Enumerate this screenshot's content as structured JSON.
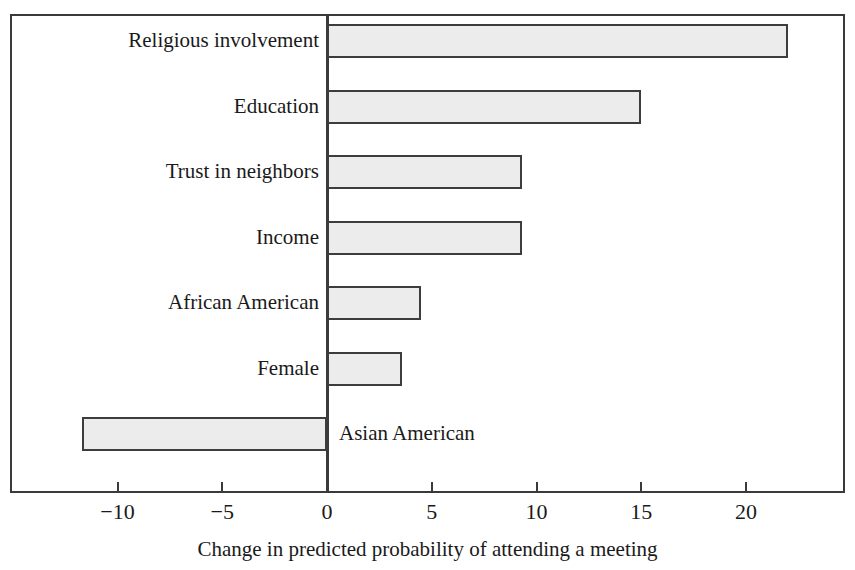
{
  "chart_data": {
    "type": "bar",
    "orientation": "horizontal",
    "title": "",
    "caption": "Change in predicted probability of attending a meeting",
    "xlabel": "Change in predicted probability of attending a meeting",
    "ylabel": "",
    "categories": [
      "Religious involvement",
      "Education",
      "Trust in neighbors",
      "Income",
      "African American",
      "Female",
      "Asian American"
    ],
    "values": [
      22.0,
      15.0,
      9.3,
      9.3,
      4.5,
      3.6,
      -11.7
    ],
    "xlim": [
      -13.5,
      24.7
    ],
    "xticks": [
      -10,
      -5,
      0,
      5,
      10,
      15,
      20
    ],
    "xtick_labels": [
      "−10",
      "−5",
      "0",
      "5",
      "10",
      "15",
      "20"
    ],
    "grid": false,
    "legend": false,
    "bar_fill_color": "#ececec",
    "bar_border_color": "#3d3d3d",
    "axis_color": "#3a3a3a",
    "frame": true
  },
  "bars": [
    {
      "label": "Religious involvement",
      "value": 22.0,
      "label_side": "left"
    },
    {
      "label": "Education",
      "value": 15.0,
      "label_side": "left"
    },
    {
      "label": "Trust in neighbors",
      "value": 9.3,
      "label_side": "left"
    },
    {
      "label": "Income",
      "value": 9.3,
      "label_side": "left"
    },
    {
      "label": "African American",
      "value": 4.5,
      "label_side": "left"
    },
    {
      "label": "Female",
      "value": 3.6,
      "label_side": "left"
    },
    {
      "label": "Asian American",
      "value": -11.7,
      "label_side": "right"
    }
  ],
  "axis": {
    "ticks": [
      {
        "value": -10,
        "text": "−10"
      },
      {
        "value": -5,
        "text": "−5"
      },
      {
        "value": 0,
        "text": "0"
      },
      {
        "value": 5,
        "text": "5"
      },
      {
        "value": 10,
        "text": "10"
      },
      {
        "value": 15,
        "text": "15"
      },
      {
        "value": 20,
        "text": "20"
      }
    ]
  },
  "caption": {
    "text": "Change in predicted probability of attending a meeting"
  }
}
